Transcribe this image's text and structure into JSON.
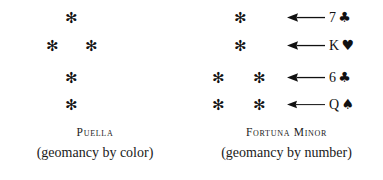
{
  "plate": {
    "figures": [
      {
        "key": "puella",
        "name": "Puella",
        "subtitle": "(geomancy by color)",
        "rows": [
          {
            "dots": 1,
            "glyph": "✻"
          },
          {
            "dots": 2,
            "glyph": "✻"
          },
          {
            "dots": 1,
            "glyph": "✻"
          },
          {
            "dots": 1,
            "glyph": "✻"
          }
        ],
        "has_arrows": false,
        "cards": []
      },
      {
        "key": "fortuna-minor",
        "name": "Fortuna Minor",
        "subtitle": "(geomancy by number)",
        "rows": [
          {
            "dots": 1,
            "glyph": "✻"
          },
          {
            "dots": 1,
            "glyph": "✻"
          },
          {
            "dots": 2,
            "glyph": "✻"
          },
          {
            "dots": 2,
            "glyph": "✻"
          }
        ],
        "has_arrows": true,
        "arrow_icon": "left-arrow-icon",
        "cards": [
          {
            "rank": "7",
            "suit": "♣",
            "suit_name": "clubs",
            "color": "#111111"
          },
          {
            "rank": "K",
            "suit": "♥",
            "suit_name": "hearts",
            "color": "#111111"
          },
          {
            "rank": "6",
            "suit": "♣",
            "suit_name": "clubs",
            "color": "#111111"
          },
          {
            "rank": "Q",
            "suit": "♠",
            "suit_name": "spades",
            "color": "#111111"
          }
        ]
      }
    ]
  },
  "colors": {
    "background": "#ffffff",
    "ink": "#1a1a1a",
    "glyph": "#111111"
  }
}
